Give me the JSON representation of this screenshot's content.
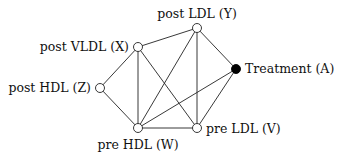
{
  "diagram": {
    "type": "undirected-graph",
    "nodes": [
      {
        "id": "Y",
        "label": "post LDL (Y)",
        "x": 197,
        "y": 28,
        "filled": false
      },
      {
        "id": "X",
        "label": "post VLDL (X)",
        "x": 138,
        "y": 47,
        "filled": false
      },
      {
        "id": "A",
        "label": "Treatment (A)",
        "x": 236,
        "y": 69,
        "filled": true
      },
      {
        "id": "Z",
        "label": "post HDL (Z)",
        "x": 100,
        "y": 88,
        "filled": false
      },
      {
        "id": "W",
        "label": "pre HDL (W)",
        "x": 138,
        "y": 128,
        "filled": false
      },
      {
        "id": "V",
        "label": "pre LDL (V)",
        "x": 197,
        "y": 128,
        "filled": false
      }
    ],
    "edges": [
      [
        "X",
        "Y"
      ],
      [
        "X",
        "Z"
      ],
      [
        "X",
        "W"
      ],
      [
        "X",
        "V"
      ],
      [
        "Y",
        "A"
      ],
      [
        "Y",
        "W"
      ],
      [
        "Y",
        "V"
      ],
      [
        "A",
        "W"
      ],
      [
        "A",
        "V"
      ],
      [
        "Z",
        "W"
      ],
      [
        "W",
        "V"
      ]
    ],
    "colors": {
      "edge": "#222222",
      "open_node_fill": "#ffffff",
      "filled_node_fill": "#000000",
      "text": "#111111"
    }
  },
  "labels": {
    "Y": "post LDL (Y)",
    "X": "post VLDL (X)",
    "A": "Treatment (A)",
    "Z": "post HDL (Z)",
    "W": "pre HDL (W)",
    "V": "pre LDL (V)"
  }
}
